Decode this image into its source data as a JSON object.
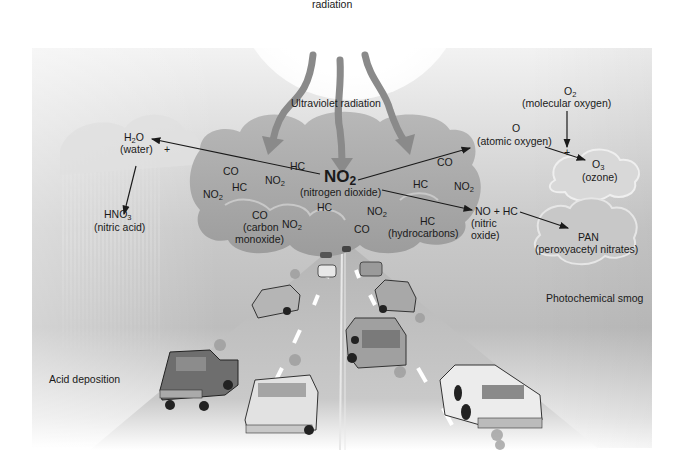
{
  "diagram": {
    "sun_label": "radiation",
    "uv_label": "Ultraviolet radiation",
    "central": {
      "formula": "NO",
      "formula_sub": "2",
      "name": "(nitrogen dioxide)"
    },
    "cloud_pollutants": [
      {
        "text": "HC"
      },
      {
        "text": "CO"
      },
      {
        "text": "NO",
        "sub": "2"
      },
      {
        "text": "HC"
      },
      {
        "text": "NO",
        "sub": "2"
      },
      {
        "text": "CO"
      },
      {
        "text": "(carbon"
      },
      {
        "text": "monoxide)"
      },
      {
        "text": "NO",
        "sub": "2"
      },
      {
        "text": "HC"
      },
      {
        "text": "NO",
        "sub": "2"
      },
      {
        "text": "CO"
      },
      {
        "text": "CO"
      },
      {
        "text": "HC"
      },
      {
        "text": "NO",
        "sub": "2"
      },
      {
        "text": "HC"
      },
      {
        "text": "(hydrocarbons)"
      }
    ],
    "water": {
      "formula": "H",
      "sub": "2",
      "formula_tail": "O",
      "name": "(water)",
      "plus": "+"
    },
    "nitric_acid": {
      "formula": "HNO",
      "sub": "3",
      "name": "(nitric acid)"
    },
    "atomic_oxygen": {
      "formula": "O",
      "name": "(atomic oxygen)"
    },
    "molecular_oxygen": {
      "formula": "O",
      "sub": "2",
      "name": "(molecular oxygen)",
      "plus": "+"
    },
    "ozone": {
      "formula": "O",
      "sub": "3",
      "name": "(ozone)"
    },
    "nitric_oxide": {
      "formula": "NO + HC",
      "name_line1": "(nitric",
      "name_line2": "oxide)"
    },
    "pan": {
      "formula": "PAN",
      "name": "(peroxyacetyl nitrates)"
    },
    "captions": {
      "photochemical_smog": "Photochemical smog",
      "acid_deposition": "Acid deposition"
    },
    "colors": {
      "background_gray": "#c4c4c4",
      "cloud_gray": "#a8a8a8",
      "uv_arrow": "#8a8a8a",
      "road": "#b0b0b0",
      "text": "#1a1a1a"
    }
  }
}
